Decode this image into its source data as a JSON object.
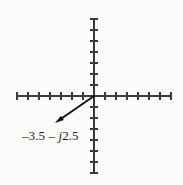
{
  "figure": {
    "name": "complex-plane-phasor-diagram",
    "background_color": "#fbfbfa",
    "axis_color": "#3a3a3a",
    "vector_color": "#111111",
    "label_color": "#1b1b1b"
  },
  "axes": {
    "real_axis": {
      "name": "horizontal-axis",
      "x_start": 16,
      "x_end": 170,
      "y": 96,
      "tick_spacing": 11,
      "tick_half_length": 4,
      "ticks_left_of_origin": 7,
      "ticks_right_of_origin": 7
    },
    "imaginary_axis": {
      "name": "vertical-axis",
      "y_start": 18,
      "y_end": 173,
      "x": 94,
      "tick_spacing": 11,
      "tick_half_length": 4,
      "ticks_above_origin": 7,
      "ticks_below_origin": 7
    },
    "origin": {
      "x": 94,
      "y": 96
    }
  },
  "vector": {
    "name": "phasor-arrow",
    "label_text": "–3.5 – ",
    "label_j": "j",
    "label_tail": "2.5",
    "real_part": -3.5,
    "imaginary_part": -2.5,
    "tail": {
      "x": 94,
      "y": 96
    },
    "tip": {
      "x": 55,
      "y": 123
    },
    "stroke_width": 1.9,
    "arrowhead_length": 9,
    "arrowhead_width": 5
  },
  "chart_data": {
    "type": "scatter",
    "title": "",
    "xlabel": "",
    "ylabel": "",
    "xlim": [
      -7,
      7
    ],
    "ylim": [
      -7,
      7
    ],
    "grid": false,
    "legend": null,
    "tick_values_x": [
      -7,
      -6,
      -5,
      -4,
      -3,
      -2,
      -1,
      0,
      1,
      2,
      3,
      4,
      5,
      6,
      7
    ],
    "tick_values_y": [
      -7,
      -6,
      -5,
      -4,
      -3,
      -2,
      -1,
      0,
      1,
      2,
      3,
      4,
      5,
      6,
      7
    ],
    "tick_labels_x": [],
    "tick_labels_y": [],
    "series": [
      {
        "name": "-3.5 - j2.5",
        "kind": "vector-from-origin",
        "x": [
          0,
          -3.5
        ],
        "y": [
          0,
          -2.5
        ],
        "annotation": "–3.5 – j2.5"
      }
    ]
  }
}
